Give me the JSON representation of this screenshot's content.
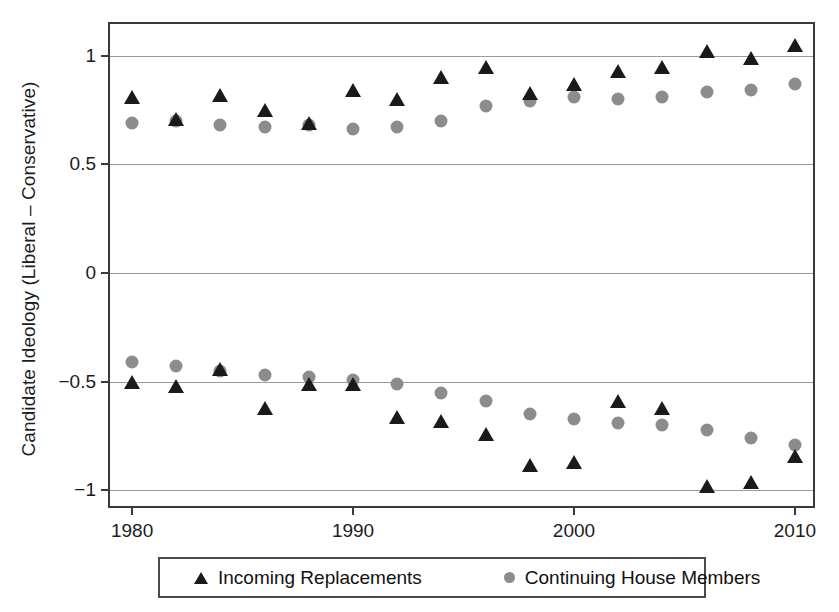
{
  "chart_data": {
    "type": "scatter",
    "title": "",
    "xlabel": "",
    "ylabel": "Candidate Ideology (Liberal – Conservative)",
    "xlim": [
      1979,
      2011
    ],
    "ylim": [
      -1.09,
      1.145
    ],
    "xticks": [
      1980,
      1990,
      2000,
      2010
    ],
    "xticklabels": [
      "1980",
      "1990",
      "2000",
      "2010"
    ],
    "yticks": [
      -1,
      -0.5,
      0,
      0.5,
      1
    ],
    "yticklabels": [
      "-1",
      "-0.5",
      "0",
      "0.5",
      "1"
    ],
    "grid": true,
    "grid_axis": "y",
    "legend_position": "below-axes",
    "x": [
      1980,
      1982,
      1984,
      1986,
      1988,
      1990,
      1992,
      1994,
      1996,
      1998,
      2000,
      2002,
      2004,
      2006,
      2008,
      2010
    ],
    "series": [
      {
        "name": "Incoming Replacements",
        "marker": "triangle",
        "color": "#1a1a1a",
        "group": "liberal",
        "values": [
          0.8,
          0.7,
          0.81,
          0.74,
          0.68,
          0.83,
          0.79,
          0.89,
          0.94,
          0.82,
          0.86,
          0.92,
          0.94,
          1.01,
          0.98,
          1.04
        ]
      },
      {
        "name": "Continuing House Members",
        "marker": "circle",
        "color": "#8c8c8c",
        "group": "liberal",
        "values": [
          0.69,
          0.7,
          0.68,
          0.67,
          0.68,
          0.66,
          0.67,
          0.7,
          0.77,
          0.79,
          0.81,
          0.8,
          0.81,
          0.83,
          0.84,
          0.87
        ]
      },
      {
        "name": "Incoming Replacements",
        "marker": "triangle",
        "color": "#1a1a1a",
        "group": "conservative",
        "values": [
          -0.51,
          -0.53,
          -0.45,
          -0.63,
          -0.52,
          -0.52,
          -0.67,
          -0.69,
          -0.75,
          -0.89,
          -0.88,
          -0.6,
          -0.63,
          -0.99,
          -0.97,
          -0.85
        ]
      },
      {
        "name": "Continuing House Members",
        "marker": "circle",
        "color": "#8c8c8c",
        "group": "conservative",
        "values": [
          -0.41,
          -0.43,
          -0.45,
          -0.47,
          -0.48,
          -0.49,
          -0.51,
          -0.55,
          -0.59,
          -0.65,
          -0.67,
          -0.69,
          -0.7,
          -0.72,
          -0.76,
          -0.79
        ]
      }
    ]
  },
  "axes": {
    "ylabel": "Candidate Ideology (Liberal – Conservative)",
    "ytick_labels": [
      "1",
      "0.5",
      "0",
      "−0.5",
      "−1"
    ],
    "xtick_labels": [
      "1980",
      "1990",
      "2000",
      "2010"
    ]
  },
  "legend": {
    "entries": [
      {
        "label": "Incoming Replacements",
        "marker": "triangle-marker-icon",
        "color": "#1a1a1a"
      },
      {
        "label": "Continuing House Members",
        "marker": "circle-marker-icon",
        "color": "#8c8c8c"
      }
    ]
  },
  "colors": {
    "incoming": "#1a1a1a",
    "continuing": "#8c8c8c",
    "grid": "#9a9a9a",
    "frame": "#3a3a3a",
    "background": "#ffffff"
  }
}
